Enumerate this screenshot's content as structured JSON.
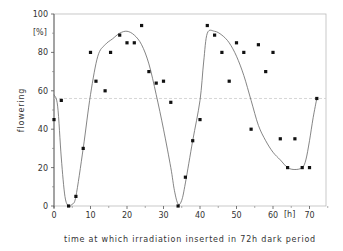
{
  "chart_data": {
    "type": "scatter",
    "title": "",
    "xlabel": "time at which irradiation inserted in 72h dark period",
    "ylabel": "flowering",
    "x_unit": "[h]",
    "y_unit": "[%]",
    "xlim": [
      0,
      74
    ],
    "ylim": [
      0,
      100
    ],
    "x_ticks": [
      0,
      10,
      20,
      30,
      40,
      50,
      60,
      70
    ],
    "y_ticks": [
      0,
      20,
      40,
      60,
      80,
      100
    ],
    "grid": false,
    "reference_line": {
      "y": 56,
      "style": "dashed"
    },
    "series": [
      {
        "name": "observed",
        "kind": "points",
        "x": [
          0,
          2,
          4,
          6,
          8,
          10,
          11.5,
          14,
          15.5,
          18,
          20,
          22,
          24,
          26,
          28,
          30,
          32,
          34,
          36,
          38,
          40,
          42,
          44,
          46,
          48,
          50,
          52,
          54,
          56,
          58,
          60,
          62,
          64,
          66,
          68,
          70,
          72
        ],
        "values": [
          45,
          55,
          0,
          5,
          30,
          80,
          65,
          60,
          80,
          89,
          85,
          85,
          94,
          70,
          64,
          65,
          54,
          0,
          15,
          34,
          45,
          94,
          89,
          80,
          65,
          85,
          80,
          40,
          84,
          70,
          80,
          35,
          20,
          35,
          20,
          20,
          56
        ]
      },
      {
        "name": "fitted curve",
        "kind": "line",
        "x": [
          0,
          1,
          2,
          3,
          4,
          5,
          6,
          8,
          10,
          12,
          14,
          16,
          18,
          20,
          22,
          24,
          26,
          28,
          30,
          32,
          33,
          34,
          35,
          36,
          38,
          40,
          41,
          42,
          44,
          46,
          48,
          50,
          52,
          54,
          56,
          58,
          60,
          62,
          64,
          66,
          68,
          69,
          70,
          71,
          72
        ],
        "values": [
          58,
          52,
          25,
          5,
          0,
          1,
          5,
          30,
          58,
          78,
          84,
          87,
          90,
          91,
          89,
          84,
          74,
          58,
          40,
          20,
          8,
          1,
          3,
          12,
          34,
          55,
          75,
          90,
          91,
          89,
          85,
          78,
          68,
          55,
          42,
          34,
          28,
          24,
          20,
          19,
          20,
          24,
          34,
          46,
          56
        ]
      }
    ]
  }
}
